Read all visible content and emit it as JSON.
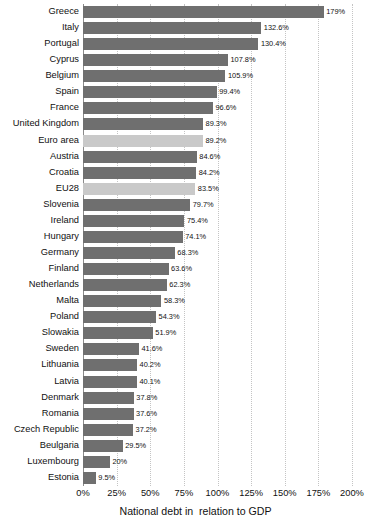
{
  "chart_data": {
    "type": "bar",
    "orientation": "horizontal",
    "title": "",
    "xlabel": "National debt in  relation to GDP",
    "ylabel": "",
    "xlim": [
      0,
      200
    ],
    "xtick_labels": [
      "0%",
      "25%",
      "50%",
      "75%",
      "100%",
      "125%",
      "150%",
      "175%",
      "200%"
    ],
    "xticks": [
      0,
      25,
      50,
      75,
      100,
      125,
      150,
      175,
      200
    ],
    "grid": true,
    "legend": "none",
    "colors": {
      "bar": "#6f6f6f",
      "highlight_bar": "#c9c9c9",
      "gridline": "#c4c4c4",
      "background": "#ffffff"
    },
    "categories": [
      "Greece",
      "Italy",
      "Portugal",
      "Cyprus",
      "Belgium",
      "Spain",
      "France",
      "United Kingdom",
      "Euro area",
      "Austria",
      "Croatia",
      "EU28",
      "Slovenia",
      "Ireland",
      "Hungary",
      "Germany",
      "Finland",
      "Netherlands",
      "Malta",
      "Poland",
      "Slowakia",
      "Sweden",
      "Lithuania",
      "Latvia",
      "Denmark",
      "Romania",
      "Czech Republic",
      "Beulgaria",
      "Luxembourg",
      "Estonia"
    ],
    "values": [
      179,
      132.6,
      130.4,
      107.8,
      105.9,
      99.4,
      96.6,
      89.3,
      89.2,
      84.6,
      84.2,
      83.5,
      79.7,
      75.4,
      74.1,
      68.3,
      63.6,
      62.3,
      58.3,
      54.3,
      51.9,
      41.6,
      40.2,
      40.1,
      37.8,
      37.6,
      37.2,
      29.5,
      20,
      9.5
    ],
    "value_labels": [
      "179%",
      "132.6%",
      "130.4%",
      "107.8%",
      "105.9%",
      "99.4%",
      "96.6%",
      "89.3%",
      "89.2%",
      "84.6%",
      "84.2%",
      "83.5%",
      "79.7%",
      "75.4%",
      "74.1%",
      "68.3%",
      "63.6%",
      "62.3%",
      "58.3%",
      "54.3%",
      "51.9%",
      "41.6%",
      "40.2%",
      "40.1%",
      "37.8%",
      "37.6%",
      "37.2%",
      "29.5%",
      "20%",
      "9.5%"
    ],
    "highlighted_categories": [
      "Euro area",
      "EU28"
    ]
  }
}
